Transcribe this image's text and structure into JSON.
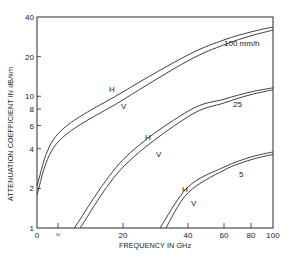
{
  "chart_data": {
    "type": "line",
    "title": "",
    "xlabel": "FREQUENCY IN GHz",
    "ylabel": "ATTENUATION COEFFICIENT IN dB/km",
    "xscale": "nonlinear (as drawn)",
    "yscale": "log",
    "xlim": [
      0,
      100
    ],
    "ylim": [
      1,
      40
    ],
    "grid": false,
    "legend": "inline curve labels",
    "x_ticks": [
      {
        "value": 0,
        "label": "0"
      },
      {
        "value": 10,
        "label": "10"
      },
      {
        "value": 20,
        "label": "20"
      },
      {
        "value": 40,
        "label": "40"
      },
      {
        "value": 60,
        "label": "60"
      },
      {
        "value": 80,
        "label": "80"
      },
      {
        "value": 100,
        "label": "100"
      }
    ],
    "y_ticks": [
      {
        "value": 1,
        "label": "1"
      },
      {
        "value": 2,
        "label": "2"
      },
      {
        "value": 4,
        "label": "4"
      },
      {
        "value": 6,
        "label": "6"
      },
      {
        "value": 8,
        "label": "8"
      },
      {
        "value": 10,
        "label": "10"
      },
      {
        "value": 20,
        "label": "20"
      },
      {
        "value": 40,
        "label": "40"
      }
    ],
    "series": [
      {
        "name": "100 mm/h H",
        "rain_rate": "100 mm/h",
        "polarization": "H",
        "x": [
          0,
          10,
          20,
          40,
          60,
          80,
          100
        ],
        "y": [
          2.1,
          5.2,
          10.8,
          20.6,
          26.8,
          30.8,
          33.6
        ]
      },
      {
        "name": "100 mm/h V",
        "rain_rate": "100 mm/h",
        "polarization": "V",
        "x": [
          0,
          10,
          20,
          40,
          60,
          80,
          100
        ],
        "y": [
          1.8,
          4.5,
          9.4,
          18.6,
          24.6,
          28.8,
          31.8
        ]
      },
      {
        "name": "25 mm/h H",
        "rain_rate": "25",
        "polarization": "H",
        "x": [
          12.5,
          20,
          40,
          60,
          80,
          100
        ],
        "y": [
          1.0,
          3.3,
          7.7,
          9.5,
          10.8,
          11.6
        ]
      },
      {
        "name": "25 mm/h V",
        "rain_rate": "25",
        "polarization": "V",
        "x": [
          13.4,
          20,
          40,
          60,
          80,
          100
        ],
        "y": [
          1.0,
          2.9,
          7.0,
          8.9,
          10.3,
          11.2
        ]
      },
      {
        "name": "5 mm/h H",
        "rain_rate": "5",
        "polarization": "H",
        "x": [
          31.4,
          40,
          60,
          80,
          100
        ],
        "y": [
          1.0,
          2.05,
          2.9,
          3.46,
          3.78
        ]
      },
      {
        "name": "5 mm/h V",
        "rain_rate": "5",
        "polarization": "V",
        "x": [
          33.2,
          40,
          60,
          80,
          100
        ],
        "y": [
          1.0,
          1.85,
          2.75,
          3.3,
          3.62
        ]
      }
    ],
    "annotations": [
      {
        "text": "100 mm/h",
        "x_px": 224,
        "y_px": 46
      },
      {
        "text": "25",
        "x_px": 233,
        "y_px": 107
      },
      {
        "text": "5",
        "x_px": 239,
        "y_px": 177
      },
      {
        "text": "H",
        "x_px": 109,
        "y_px": 92
      },
      {
        "text": "V",
        "x_px": 121,
        "y_px": 109
      },
      {
        "text": "H",
        "x_px": 145,
        "y_px": 140
      },
      {
        "text": "V",
        "x_px": 156,
        "y_px": 157
      },
      {
        "text": "H",
        "x_px": 182,
        "y_px": 192
      },
      {
        "text": "V",
        "x_px": 191,
        "y_px": 206
      }
    ]
  },
  "layout": {
    "plot_left": 37,
    "plot_right": 273,
    "plot_top": 17,
    "plot_bottom": 228,
    "x_tick_px": {
      "0": 37,
      "10": 58,
      "20": 123,
      "40": 188,
      "60": 224,
      "80": 251,
      "100": 273
    }
  }
}
